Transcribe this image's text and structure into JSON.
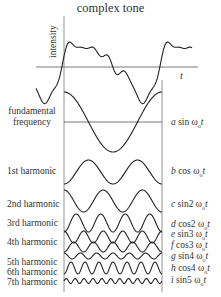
{
  "title": "complex tone",
  "axes": {
    "ylabel": "intensity",
    "xlabel": "t"
  },
  "rows": [
    {
      "label": "fundamental frequency",
      "label_line1": "fundamental",
      "label_line2": "frequency",
      "coef": "a",
      "func": "sin",
      "mult": "",
      "formula": "a sin ω0t"
    },
    {
      "label": "1st harmonic",
      "coef": "b",
      "func": "cos",
      "mult": "",
      "formula": "b cos ω0t"
    },
    {
      "label": "2nd harmonic",
      "coef": "c",
      "func": "sin",
      "mult": "2",
      "formula": "c sin2 ω0t"
    },
    {
      "label": "3rd harmonic",
      "coef": "d",
      "func": "cos",
      "mult": "2",
      "formula": "d cos2 ω0t"
    },
    {
      "label": "",
      "coef": "e",
      "func": "sin",
      "mult": "3",
      "formula": "e sin3 ω0t"
    },
    {
      "label": "4th harmonic",
      "coef": "f",
      "func": "cos",
      "mult": "3",
      "formula": "f cos3 ω0t"
    },
    {
      "label": "",
      "coef": "g",
      "func": "sin",
      "mult": "4",
      "formula": "g sin4 ω0t"
    },
    {
      "label": "5th harmonic",
      "coef": "h",
      "func": "cos",
      "mult": "4",
      "formula": "h cos4 ω0t"
    },
    {
      "label": "6th harmonic",
      "coef": "i",
      "func": "sin",
      "mult": "5",
      "formula": "i sin5 ω0t"
    },
    {
      "label": "7th harmonic"
    }
  ],
  "labels": {
    "fundamental_1": "fundamental",
    "fundamental_2": "frequency",
    "h1": "1st harmonic",
    "h2": "2nd harmonic",
    "h3": "3rd harmonic",
    "h4": "4th harmonic",
    "h5": "5th harmonic",
    "h6": "6th harmonic",
    "h7": "7th harmonic"
  },
  "formulas": {
    "f1": {
      "coef": "a",
      "rest": " sin ω",
      "sub": "o",
      "t": "t"
    },
    "f2": {
      "coef": "b",
      "rest": " cos ω",
      "sub": "o",
      "t": "t"
    },
    "f3": {
      "coef": "c",
      "rest": " sin2 ω",
      "sub": "o",
      "t": "t"
    },
    "f4": {
      "coef": "d",
      "rest": " cos2 ω",
      "sub": "o",
      "t": "t"
    },
    "f5": {
      "coef": "e",
      "rest": " sin3 ω",
      "sub": "o",
      "t": "t"
    },
    "f6": {
      "coef": "f",
      "rest": " cos3 ω",
      "sub": "o",
      "t": "t"
    },
    "f7": {
      "coef": "g",
      "rest": " sin4 ω",
      "sub": "o",
      "t": "t"
    },
    "f8": {
      "coef": "h",
      "rest": " cos4 ω",
      "sub": "o",
      "t": "t"
    },
    "f9": {
      "coef": "i",
      "rest": " sin5 ω",
      "sub": "o",
      "t": "t"
    }
  },
  "colors": {
    "stroke": "#222222",
    "text": "#333333",
    "axis": "#555555"
  }
}
